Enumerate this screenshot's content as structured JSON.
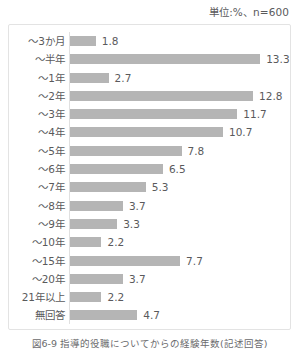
{
  "header": {
    "unit_note": "単位:%、n=600"
  },
  "caption": "図6-9 指導的役職についてからの経験年数(記述回答)",
  "chart_data": {
    "type": "bar",
    "orientation": "horizontal",
    "title": "",
    "subtitle": "",
    "xlabel": "",
    "ylabel": "",
    "unit": "%",
    "sample_size": 600,
    "grid": false,
    "legend": "none",
    "xlim": [
      0,
      13.3
    ],
    "categories": [
      "～3か月",
      "～半年",
      "～1年",
      "～2年",
      "～3年",
      "～4年",
      "～5年",
      "～6年",
      "～7年",
      "～8年",
      "～9年",
      "～10年",
      "～15年",
      "～20年",
      "21年以上",
      "無回答"
    ],
    "values": [
      1.8,
      13.3,
      2.7,
      12.8,
      11.7,
      10.7,
      7.8,
      6.5,
      5.3,
      3.7,
      3.3,
      2.2,
      7.7,
      3.7,
      2.2,
      4.7
    ],
    "value_labels": [
      "1.8",
      "13.3",
      "2.7",
      "12.8",
      "11.7",
      "10.7",
      "7.8",
      "6.5",
      "5.3",
      "3.7",
      "3.3",
      "2.2",
      "7.7",
      "3.7",
      "2.2",
      "4.7"
    ],
    "bar_color": "#b5b5b5",
    "text_color": "#5a5a5c"
  }
}
